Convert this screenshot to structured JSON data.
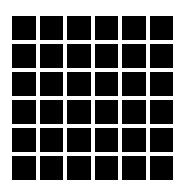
{
  "grid": {
    "rows": 6,
    "columns": 6,
    "cell_color": "#000000",
    "gap_color": "#ffffff",
    "background": "#ffffff"
  }
}
